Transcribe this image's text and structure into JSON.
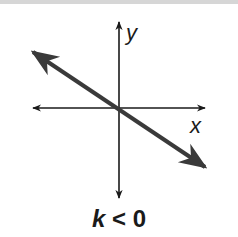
{
  "diagram": {
    "axes": {
      "x_label": "x",
      "y_label": "y"
    },
    "line": {
      "direction": "decreasing",
      "passes_through_origin": true,
      "color": "#3a3a3a"
    },
    "caption": {
      "variable": "k",
      "relation": " < 0"
    },
    "colors": {
      "axis": "#1a1a1a",
      "line": "#3a3a3a",
      "background": "#ffffff"
    }
  }
}
